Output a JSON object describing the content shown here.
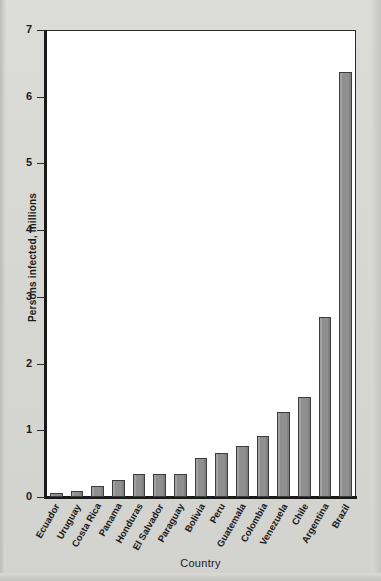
{
  "chart_data": {
    "type": "bar",
    "title": "",
    "xlabel": "Country",
    "ylabel": "Persons infected, millions",
    "ylim": [
      0,
      7
    ],
    "yticks": [
      0,
      1,
      2,
      3,
      4,
      5,
      6,
      7
    ],
    "ytick_labels": [
      "0",
      "1",
      "2",
      "3",
      "4",
      "5",
      "6",
      "7"
    ],
    "grid": false,
    "legend": "none",
    "bar_color": "#8f8f8f",
    "bar_edge_color": "#3c3c3c",
    "plot_background": "#ffffff",
    "page_background": "#d9d9d6",
    "categories": [
      "Ecuador",
      "Uruguay",
      "Costa Rica",
      "Panama",
      "Honduras",
      "El Salvador",
      "Paraguay",
      "Bolivia",
      "Peru",
      "Guatemala",
      "Colombia",
      "Venezuela",
      "Chile",
      "Argentina",
      "Brazil"
    ],
    "values": [
      0.06,
      0.09,
      0.17,
      0.26,
      0.34,
      0.35,
      0.35,
      0.59,
      0.66,
      0.76,
      0.92,
      1.27,
      1.5,
      2.7,
      6.37
    ]
  }
}
